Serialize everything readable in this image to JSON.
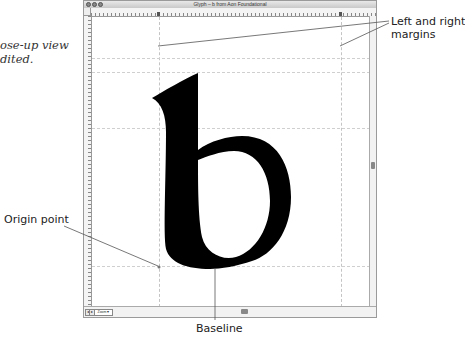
{
  "annotations": {
    "caption": "ose-up view\ndited.",
    "margins_label": "Left and right\nmargins",
    "origin_label": "Origin point",
    "baseline_label": "Baseline"
  },
  "window": {
    "title": "Glyph – b from Aon Foundational",
    "glyph": "b",
    "zoom_label": "Zoom ▾",
    "ruler_h_numbers": [
      "-100",
      "-50",
      "0",
      "50",
      "100",
      "150",
      "200",
      "250",
      "300",
      "350",
      "400"
    ],
    "ruler_v_labels": [
      "xh",
      "as",
      "cap"
    ],
    "scroll_buttons": [
      "◂",
      "▸",
      "▴",
      "▾"
    ]
  },
  "colors": {
    "glyph_fill": "#000000",
    "guide": "#c4c4c4",
    "callout_line": "#555555"
  }
}
